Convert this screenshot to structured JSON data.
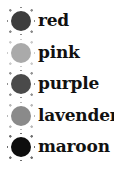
{
  "items": [
    {
      "label": "red",
      "color": "#3d3d3d"
    },
    {
      "label": "pink",
      "color": "#aaaaaa"
    },
    {
      "label": "purple",
      "color": "#4a4a4a"
    },
    {
      "label": "lavender",
      "color": "#8a8a8a"
    },
    {
      "label": "maroon",
      "color": "#0e0e0e"
    }
  ]
}
